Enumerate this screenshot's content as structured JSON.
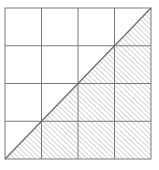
{
  "diagram": {
    "type": "grid-with-shaded-triangle",
    "grid": {
      "rows": 4,
      "columns": 4
    },
    "shaded_region": "lower-right triangle below diagonal from bottom-left to top-right",
    "colors": {
      "background": "#ffffff",
      "grid_line": "#7a7a7a",
      "diagonal": "#6e6e6e",
      "hatch": "#9a9a9a"
    }
  }
}
